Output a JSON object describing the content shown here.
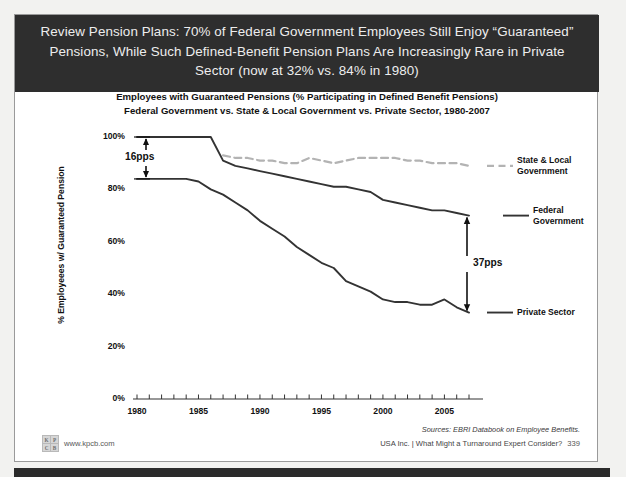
{
  "slide": {
    "header_title": "Review Pension Plans: 70% of Federal Government Employees Still Enjoy “Guaranteed” Pensions, While Such Defined-Benefit Pension Plans Are Increasingly Rare in Private Sector (now at 32% vs. 84% in 1980)",
    "page_number": "339",
    "footer_text": "USA Inc. | What Might a Turnaround Expert Consider?",
    "source_text": "Sources: EBRI Databook on Employee Benefits.",
    "brand_url": "www.kpcb.com",
    "logo_letters": [
      "K",
      "P",
      "C",
      "B"
    ]
  },
  "chart_data": {
    "type": "line",
    "title": "Employees with Guaranteed Pensions (% Participating in Defined Benefit Pensions)",
    "subtitle": "Federal Government vs. State & Local Government vs. Private Sector, 1980-2007",
    "xlabel": "",
    "ylabel": "% Employeees w/ Guaranteed Pension",
    "xlim": [
      1980,
      2007
    ],
    "ylim": [
      0,
      100
    ],
    "yticks": [
      "0%",
      "20%",
      "40%",
      "60%",
      "80%",
      "100%"
    ],
    "ytick_values": [
      0,
      20,
      40,
      60,
      80,
      100
    ],
    "xticks": [
      "1980",
      "1985",
      "1990",
      "1995",
      "2000",
      "2005"
    ],
    "xtick_values": [
      1980,
      1985,
      1990,
      1995,
      2000,
      2005
    ],
    "grid": false,
    "legend_position": "right",
    "x": [
      1980,
      1981,
      1982,
      1983,
      1984,
      1985,
      1986,
      1987,
      1988,
      1989,
      1990,
      1991,
      1992,
      1993,
      1994,
      1995,
      1996,
      1997,
      1998,
      1999,
      2000,
      2001,
      2002,
      2003,
      2004,
      2005,
      2006,
      2007
    ],
    "series": [
      {
        "name": "Federal Government",
        "style": "solid",
        "color": "#333333",
        "values": [
          100,
          100,
          100,
          100,
          100,
          100,
          100,
          91,
          89,
          88,
          87,
          86,
          85,
          84,
          83,
          82,
          81,
          81,
          80,
          79,
          76,
          75,
          74,
          73,
          72,
          72,
          71,
          70
        ]
      },
      {
        "name": "State & Local Government",
        "style": "dashed",
        "color": "#b3b3b3",
        "values": [
          null,
          null,
          null,
          null,
          null,
          null,
          null,
          93,
          92,
          92,
          91,
          91,
          90,
          90,
          92,
          91,
          90,
          91,
          92,
          92,
          92,
          92,
          91,
          91,
          90,
          90,
          90,
          89
        ]
      },
      {
        "name": "Private Sector",
        "style": "solid",
        "color": "#333333",
        "values": [
          84,
          84,
          84,
          84,
          84,
          83,
          80,
          78,
          75,
          72,
          68,
          65,
          62,
          58,
          55,
          52,
          50,
          45,
          43,
          41,
          38,
          37,
          37,
          36,
          36,
          38,
          35,
          33
        ]
      }
    ],
    "annotations": [
      {
        "label": "16pps",
        "year": 1980,
        "from": 100,
        "to": 84
      },
      {
        "label": "37pps",
        "year": 2007,
        "from": 70,
        "to": 33
      }
    ]
  }
}
